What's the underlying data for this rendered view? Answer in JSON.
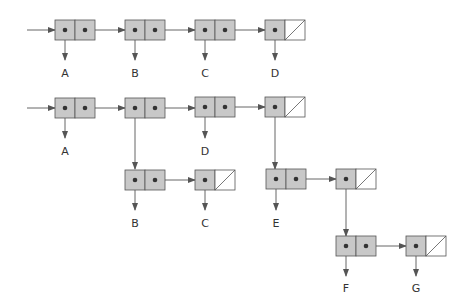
{
  "diagram": {
    "type": "box-and-pointer",
    "colors": {
      "car_fill": "#c8c8c8",
      "stroke": "#555555",
      "arrow": "#555555",
      "dot": "#333333"
    },
    "list1": {
      "description": "(A B C D)",
      "labels": [
        "A",
        "B",
        "C",
        "D"
      ]
    },
    "list2": {
      "description": "(A (B C) D (E (F G)))",
      "labels": [
        "A",
        "D",
        "B",
        "C",
        "E",
        "F",
        "G"
      ]
    }
  }
}
